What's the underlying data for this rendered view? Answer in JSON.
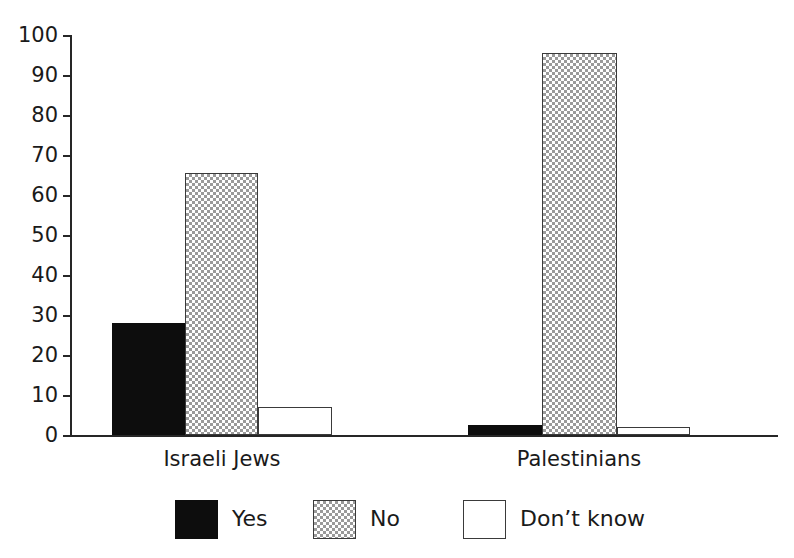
{
  "chart_data": {
    "type": "bar",
    "title": "",
    "subtitle": "",
    "xlabel": "",
    "ylabel": "",
    "categories": [
      "Israeli Jews",
      "Palestinians"
    ],
    "series": [
      {
        "name": "Yes",
        "values": [
          28,
          2.5
        ],
        "swatch": "black",
        "color": "#0d0d0d"
      },
      {
        "name": "No",
        "values": [
          65.5,
          95.5
        ],
        "swatch": "dotted-gray",
        "color": "#9a9a9a"
      },
      {
        "name": "Don’t know",
        "values": [
          7,
          2
        ],
        "swatch": "white",
        "color": "#ffffff"
      }
    ],
    "ylim": [
      0,
      100
    ],
    "yticks": [
      0,
      10,
      20,
      30,
      40,
      50,
      60,
      70,
      80,
      90,
      100
    ],
    "ytick_labels": [
      "0",
      "10",
      "20",
      "30",
      "40",
      "50",
      "60",
      "70",
      "80",
      "90",
      "100"
    ],
    "grid": false,
    "legend_position": "bottom",
    "legend_entries": [
      "Yes",
      "No",
      "Don’t know"
    ]
  },
  "axis": {
    "y_tick_labels": [
      "100",
      "90",
      "80",
      "70",
      "60",
      "50",
      "40",
      "30",
      "20",
      "10",
      "0"
    ]
  },
  "legend": {
    "items": [
      {
        "label": "Yes"
      },
      {
        "label": "No"
      },
      {
        "label": "Don’t know"
      }
    ]
  },
  "groups": [
    {
      "label": "Israeli Jews"
    },
    {
      "label": "Palestinians"
    }
  ]
}
